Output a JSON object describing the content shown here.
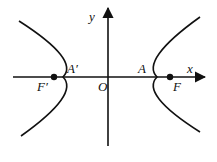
{
  "diagram": {
    "type": "hyperbola",
    "axes": {
      "x_label": "x",
      "y_label": "y",
      "origin_label": "O"
    },
    "points": {
      "left_vertex": "A′",
      "right_vertex": "A",
      "left_focus": "F′",
      "right_focus": "F"
    },
    "colors": {
      "stroke": "#111111",
      "background": "#ffffff"
    }
  }
}
